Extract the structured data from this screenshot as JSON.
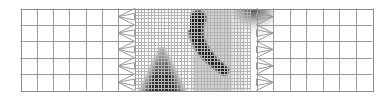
{
  "figure": {
    "title": "Adaptive mesh refinement domain with scalar field",
    "width": 390,
    "height": 98,
    "background_color": "#ffffff"
  },
  "chart_data": {
    "type": "heatmap",
    "title": "Adaptive mesh refinement domain with scalar field",
    "xlabel": "",
    "ylabel": "",
    "grid": true,
    "legend": null,
    "xlim": [
      0,
      1
    ],
    "ylim": [
      0,
      1
    ],
    "domain_px": {
      "left": 20.5,
      "top": 8.5,
      "right": 372.5,
      "bottom": 90.5
    },
    "colors": {
      "line_coarse": "#9a9a9a",
      "line_fine": "#b4b4b4",
      "line_transition": "#9a9a9a",
      "border": "#8c8c8c",
      "field_dark": "#1a1a1a",
      "field_mid": "#8d8d8d",
      "field_light": "#d8d8d8",
      "block_shade": "#c9c9c9",
      "background": "#ffffff"
    },
    "mesh": {
      "description": "Three-level block-structured mesh: coarse quadrilateral cells on the left and right flanks, chevron transition layers, and a uniformly refined fine-cell core in the centre.",
      "rows_coarse": 5,
      "regions": [
        {
          "name": "coarse-left",
          "x0": 20.5,
          "x1": 118.0,
          "cols": 6,
          "level": 0
        },
        {
          "name": "transition-left",
          "x0": 118.0,
          "x1": 134.5,
          "cols": 1,
          "level": 1
        },
        {
          "name": "fine-core",
          "x0": 134.5,
          "x1": 250.0,
          "cols": 35,
          "level": 2
        },
        {
          "name": "transition-right",
          "x0": 256.5,
          "x1": 273.0,
          "cols": 1,
          "level": 1
        },
        {
          "name": "coarse-right",
          "x0": 273.0,
          "x1": 372.5,
          "cols": 6,
          "level": 0
        }
      ],
      "fine_cell_px": 3.3,
      "coarse_cell_px": 16.4,
      "shaded_block": {
        "x0": 190.0,
        "x1": 236.0,
        "y0": 8.5,
        "y1": 90.5
      },
      "white_gap": {
        "x0": 186.0,
        "x1": 190.0,
        "y0": 8.5,
        "y1": 30.0
      }
    },
    "features": [
      {
        "name": "triangular-plume",
        "shape": "triangle",
        "description": "Dark triangular plume rising from the lower boundary of the fine mesh",
        "apex": [
          162,
          47
        ],
        "base": [
          [
            143,
            90
          ],
          [
            182,
            90
          ]
        ],
        "peak_intensity": 0.92
      },
      {
        "name": "crescent-band",
        "shape": "crescent",
        "description": "Curved crescent-shaped high-intensity band in the shaded central block",
        "start": [
          198,
          18
        ],
        "end": [
          224,
          70
        ],
        "thickness_px": 11,
        "peak_intensity": 0.97
      },
      {
        "name": "corner-blob",
        "shape": "blob",
        "description": "Diffuse dark blob at the upper right of the fine region spanning the right transition",
        "center": [
          253,
          8
        ],
        "radius_px": 22,
        "peak_intensity": 0.7
      }
    ]
  }
}
